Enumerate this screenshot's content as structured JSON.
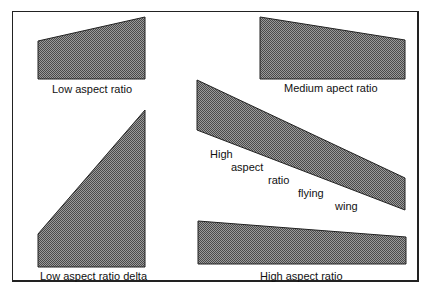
{
  "diagram": {
    "fill_color": "#7a7a7a",
    "outline_color": "#222222",
    "shapes": [
      {
        "name": "low-aspect-ratio",
        "label": "Low aspect ratio",
        "points": "38,41 145,17 145,79 38,79"
      },
      {
        "name": "medium-aspect-ratio",
        "label": "Medium apect ratio",
        "points": "260,17 405,40 405,79 260,79"
      },
      {
        "name": "high-aspect-ratio-flying-wing",
        "label_words": [
          "High",
          "aspect",
          "ratio",
          "flying",
          "wing"
        ],
        "points": "197,80 405,178 405,210 197,130"
      },
      {
        "name": "low-aspect-ratio-delta",
        "label": "Low aspect ratio delta",
        "points": "38,234 145,110 145,267 38,267"
      },
      {
        "name": "high-aspect-ratio",
        "label": "High aspect ratio",
        "points": "198,221 406,237 406,264 198,264"
      }
    ]
  }
}
